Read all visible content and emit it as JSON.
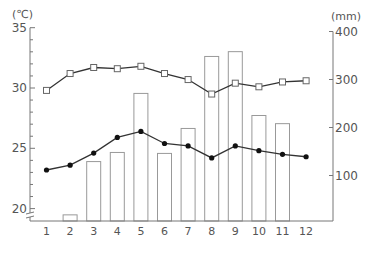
{
  "chart_data": {
    "type": "bar+line",
    "title": "",
    "categories": [
      "1",
      "2",
      "3",
      "4",
      "5",
      "6",
      "7",
      "8",
      "9",
      "10",
      "11",
      "12"
    ],
    "xlabel": "",
    "left_axis": {
      "unit_label": "(℃)",
      "ticks": [
        20,
        25,
        30,
        35
      ],
      "ylim": [
        19,
        35
      ],
      "minor_step": 1,
      "axis_break": true
    },
    "right_axis": {
      "unit_label": "(mm)",
      "ticks": [
        100,
        200,
        300,
        400
      ],
      "ylim": [
        0,
        400
      ]
    },
    "grid": false,
    "legend": null,
    "series": [
      {
        "name": "max_temperature",
        "axis": "left",
        "kind": "line",
        "marker": "open-square",
        "values": [
          29.8,
          31.2,
          31.7,
          31.6,
          31.8,
          31.2,
          30.7,
          29.5,
          30.4,
          30.1,
          30.5,
          30.6
        ]
      },
      {
        "name": "min_temperature",
        "axis": "left",
        "kind": "line",
        "marker": "filled-circle",
        "values": [
          23.2,
          23.6,
          24.6,
          25.9,
          26.4,
          25.4,
          25.2,
          24.2,
          25.2,
          24.8,
          24.5,
          24.3
        ]
      },
      {
        "name": "precipitation",
        "axis": "right",
        "kind": "bar",
        "style": "outline",
        "values": [
          0,
          18,
          129,
          148,
          271,
          146,
          198,
          348,
          358,
          225,
          208,
          0
        ]
      }
    ]
  },
  "colors": {
    "axis": "#777777",
    "line": "#333333",
    "bar_stroke": "#999999",
    "text": "#555555"
  }
}
